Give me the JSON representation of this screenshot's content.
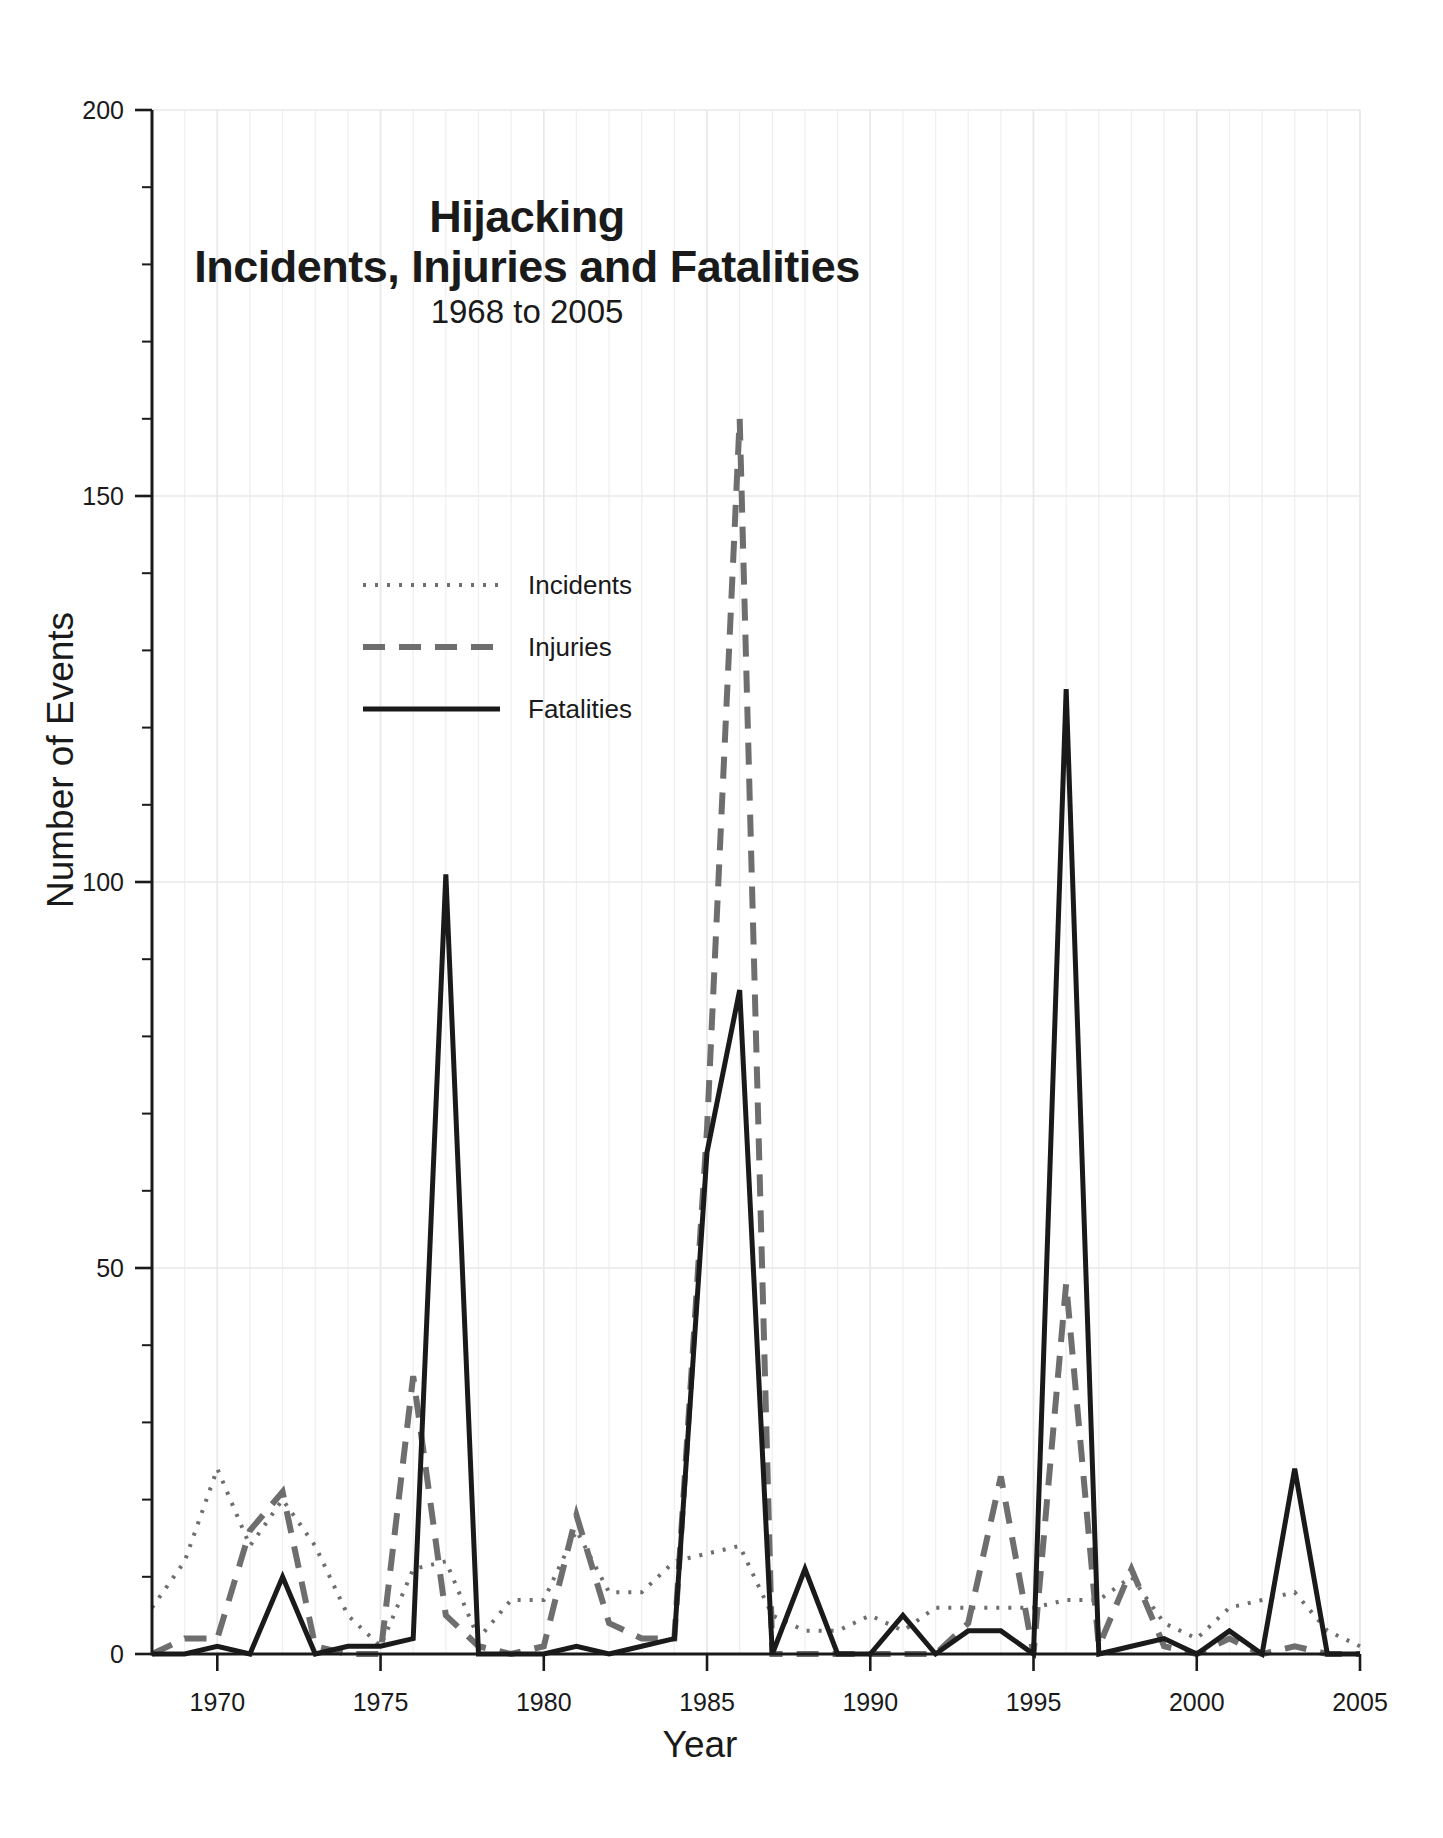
{
  "chart_data": {
    "type": "line",
    "title": "Hijacking\nIncidents, Injuries and Fatalities",
    "title_line1": "Hijacking",
    "title_line2": "Incidents, Injuries and Fatalities",
    "subtitle": "1968 to 2005",
    "xlabel": "Year",
    "ylabel": "Number of Events",
    "xlim": [
      1968,
      2005
    ],
    "ylim": [
      0,
      200
    ],
    "y_ticks": [
      0,
      50,
      100,
      150,
      200
    ],
    "y_tick_labels": [
      "0",
      "50",
      "100",
      "150",
      "200"
    ],
    "y_minor_interval": 10,
    "x_ticks": [
      1970,
      1975,
      1980,
      1985,
      1990,
      1995,
      2000,
      2005
    ],
    "x_tick_labels": [
      "1970",
      "1975",
      "1980",
      "1985",
      "1990",
      "1995",
      "2000",
      "2005"
    ],
    "x_minor_interval": 1,
    "grid": true,
    "grid_color": "#e8e8e8",
    "legend_position": "upper-left-inside",
    "x": [
      1968,
      1969,
      1970,
      1971,
      1972,
      1973,
      1974,
      1975,
      1976,
      1977,
      1978,
      1979,
      1980,
      1981,
      1982,
      1983,
      1984,
      1985,
      1986,
      1987,
      1988,
      1989,
      1990,
      1991,
      1992,
      1993,
      1994,
      1995,
      1996,
      1997,
      1998,
      1999,
      2000,
      2001,
      2002,
      2003,
      2004,
      2005
    ],
    "series": [
      {
        "name": "Incidents",
        "style": "dotted",
        "color": "#6e6e6e",
        "width": 4,
        "dash": "3,9",
        "values": [
          6,
          12,
          24,
          14,
          20,
          14,
          5,
          1,
          11,
          12,
          2,
          7,
          7,
          16,
          8,
          8,
          12,
          13,
          14,
          5,
          3,
          3,
          5,
          3,
          6,
          6,
          6,
          6,
          7,
          7,
          10,
          4,
          2,
          6,
          7,
          8,
          3,
          1
        ]
      },
      {
        "name": "Injuries",
        "style": "long-dash",
        "color": "#6e6e6e",
        "width": 6,
        "dash": "22,14",
        "values": [
          0,
          2,
          2,
          16,
          21,
          1,
          0,
          0,
          36,
          5,
          1,
          0,
          1,
          18,
          4,
          2,
          2,
          68,
          160,
          0,
          0,
          0,
          0,
          0,
          0,
          4,
          23,
          0,
          48,
          1,
          11,
          1,
          0,
          2,
          0,
          1,
          0,
          0
        ]
      },
      {
        "name": "Fatalities",
        "style": "solid",
        "color": "#1a1a1a",
        "width": 5,
        "dash": "none",
        "values": [
          0,
          0,
          1,
          0,
          10,
          0,
          1,
          1,
          2,
          101,
          0,
          0,
          0,
          1,
          0,
          1,
          2,
          65,
          86,
          0,
          11,
          0,
          0,
          5,
          0,
          3,
          3,
          0,
          125,
          0,
          1,
          2,
          0,
          3,
          0,
          24,
          0,
          0
        ]
      }
    ]
  },
  "legend": {
    "items": [
      {
        "label": "Incidents"
      },
      {
        "label": "Injuries"
      },
      {
        "label": "Fatalities"
      }
    ]
  }
}
